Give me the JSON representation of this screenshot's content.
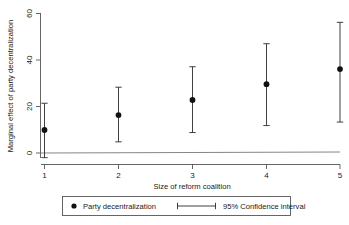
{
  "chart_data": {
    "type": "scatter",
    "title": "",
    "xlabel": "Size of reform coalition",
    "ylabel": "Marginal effect of party decentralization",
    "x": [
      1,
      2,
      3,
      4,
      5
    ],
    "xticklabels": [
      "1",
      "2",
      "3",
      "4",
      "5"
    ],
    "yticklabels": [
      "0",
      "20",
      "40",
      "60"
    ],
    "yticks": [
      0,
      20,
      40,
      60
    ],
    "xlim": [
      0.75,
      5.25
    ],
    "ylim": [
      -5,
      62
    ],
    "grid": false,
    "zero_reference_line": 0,
    "series": [
      {
        "name": "Party decentralization",
        "marker": "filled-circle",
        "values": [
          9.9,
          16.3,
          22.8,
          29.6,
          36.1
        ]
      },
      {
        "name": "95% Confidence interval",
        "marker": "capped-error-bar",
        "lower": [
          -2.0,
          4.8,
          8.8,
          11.8,
          13.3
        ],
        "upper": [
          21.4,
          28.3,
          37.1,
          47.0,
          56.2
        ]
      }
    ],
    "legend": {
      "position": "below-axes",
      "entries": [
        {
          "label": "Party decentralization",
          "marker": "filled-circle"
        },
        {
          "label": "95% Confidence interval",
          "marker": "capped-error-bar"
        }
      ]
    },
    "colors": {
      "marker": "#111111",
      "error_bar": "#2b2b2b",
      "axis": "#555555",
      "zero_line": "#777777",
      "background": "#ffffff"
    }
  },
  "axes": {
    "y_title": "Marginal effect of party decentralization",
    "x_title": "Size of reform coalition",
    "y_ticks": [
      {
        "label": "60"
      },
      {
        "label": "40"
      },
      {
        "label": "20"
      },
      {
        "label": "0"
      }
    ],
    "x_ticks": [
      {
        "label": "1"
      },
      {
        "label": "2"
      },
      {
        "label": "3"
      },
      {
        "label": "4"
      },
      {
        "label": "5"
      }
    ]
  },
  "legend": {
    "entry_point_label": "Party decentralization",
    "entry_ci_label": "95% Confidence interval"
  }
}
